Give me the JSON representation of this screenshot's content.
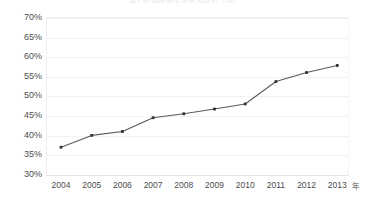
{
  "chart_data": {
    "type": "line",
    "title": "图1  我国城镇化率变化趋势（年）",
    "xlabel": "年",
    "ylabel": "",
    "categories": [
      "2004",
      "2005",
      "2006",
      "2007",
      "2008",
      "2009",
      "2010",
      "2011",
      "2012",
      "2013"
    ],
    "x": [
      2004,
      2005,
      2006,
      2007,
      2008,
      2009,
      2010,
      2011,
      2012,
      2013
    ],
    "values": [
      37.0,
      40.0,
      41.0,
      44.5,
      45.5,
      46.7,
      48.0,
      53.7,
      56.0,
      57.8
    ],
    "series": [
      {
        "name": "比例",
        "values": [
          37.0,
          40.0,
          41.0,
          44.5,
          45.5,
          46.7,
          48.0,
          53.7,
          56.0,
          57.8
        ]
      }
    ],
    "ylim": [
      30,
      70
    ],
    "ytick_values": [
      30,
      35,
      40,
      45,
      50,
      55,
      60,
      65,
      70
    ],
    "ytick_labels": [
      "30%",
      "35%",
      "40%",
      "45%",
      "50%",
      "55%",
      "60%",
      "65%",
      "70%"
    ],
    "grid": true,
    "legend": false,
    "legend_position": "none",
    "line_color": "#555555",
    "marker_color": "#333333",
    "marker_shape": "square",
    "annotations": []
  },
  "axis": {
    "x_unit_label": "年"
  }
}
